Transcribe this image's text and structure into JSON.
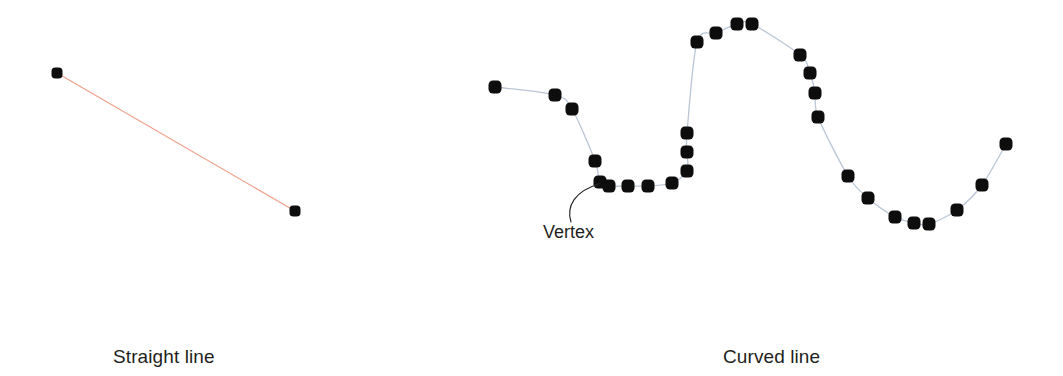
{
  "figure": {
    "background_color": "#ffffff",
    "captions": {
      "straight": "Straight line",
      "curved": "Curved line"
    },
    "annotations": [
      {
        "name": "vertex",
        "label": "Vertex",
        "label_x": 543,
        "label_y": 222,
        "leader_path": "M 571 222 C 566 206 575 191 599 184",
        "arrow_tip_x": 601,
        "arrow_tip_y": 183
      }
    ]
  },
  "colors": {
    "vertex_dot": "#0d0d0d",
    "straight_line": "#f0a08a",
    "curved_line": "#b9c6d6",
    "text": "#231f20",
    "leader_line": "#231f20"
  },
  "chart_data": {
    "type": "scatter",
    "title": "",
    "xlabel": "",
    "ylabel": "",
    "grid": false,
    "legend": "none",
    "series": [
      {
        "name": "Straight line",
        "label": "Straight line",
        "line_color": "#f0a08a",
        "line_width": 1.2,
        "vertex_size": 11,
        "smooth": false,
        "points": [
          [
            57,
            73
          ],
          [
            295,
            211
          ]
        ]
      },
      {
        "name": "Curved line",
        "label": "Curved line",
        "line_color": "#b9c6d6",
        "line_width": 1.3,
        "vertex_size": 13,
        "smooth": true,
        "points": [
          [
            495,
            87
          ],
          [
            555,
            95
          ],
          [
            572,
            109
          ],
          [
            595,
            161
          ],
          [
            600,
            182
          ],
          [
            609,
            186
          ],
          [
            628,
            186
          ],
          [
            648,
            186
          ],
          [
            672,
            183
          ],
          [
            687,
            171
          ],
          [
            687,
            152
          ],
          [
            687,
            133
          ],
          [
            697,
            42
          ],
          [
            716,
            33
          ],
          [
            737,
            24
          ],
          [
            752,
            24
          ],
          [
            800,
            55
          ],
          [
            810,
            73
          ],
          [
            815,
            93
          ],
          [
            818,
            117
          ],
          [
            848,
            176
          ],
          [
            868,
            198
          ],
          [
            895,
            217
          ],
          [
            914,
            223
          ],
          [
            929,
            224
          ],
          [
            957,
            210
          ],
          [
            982,
            185
          ],
          [
            1006,
            144
          ]
        ]
      }
    ]
  }
}
